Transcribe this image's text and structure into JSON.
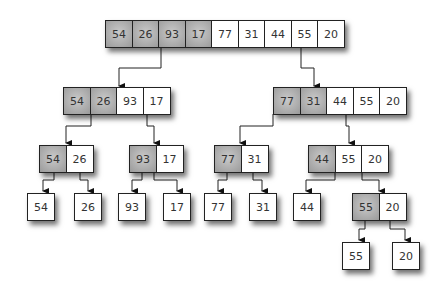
{
  "diagram": {
    "levels": [
      {
        "groups": [
          {
            "values": [
              "54",
              "26",
              "93",
              "17",
              "77",
              "31",
              "44",
              "55",
              "20"
            ],
            "highlighted": [
              0,
              1,
              2,
              3
            ]
          }
        ]
      },
      {
        "groups": [
          {
            "values": [
              "54",
              "26",
              "93",
              "17"
            ],
            "highlighted": [
              0,
              1
            ]
          },
          {
            "values": [
              "77",
              "31",
              "44",
              "55",
              "20"
            ],
            "highlighted": [
              0,
              1
            ]
          }
        ]
      },
      {
        "groups": [
          {
            "values": [
              "54",
              "26"
            ],
            "highlighted": [
              0
            ]
          },
          {
            "values": [
              "93",
              "17"
            ],
            "highlighted": [
              0
            ]
          },
          {
            "values": [
              "77",
              "31"
            ],
            "highlighted": [
              0
            ]
          },
          {
            "values": [
              "44",
              "55",
              "20"
            ],
            "highlighted": [
              0
            ]
          }
        ]
      },
      {
        "groups": [
          {
            "values": [
              "54"
            ]
          },
          {
            "values": [
              "26"
            ]
          },
          {
            "values": [
              "93"
            ]
          },
          {
            "values": [
              "17"
            ]
          },
          {
            "values": [
              "77"
            ]
          },
          {
            "values": [
              "31"
            ]
          },
          {
            "values": [
              "44"
            ]
          },
          {
            "values": [
              "55",
              "20"
            ],
            "highlighted": [
              0
            ]
          }
        ]
      },
      {
        "groups": [
          {
            "values": [
              "55"
            ]
          },
          {
            "values": [
              "20"
            ]
          }
        ]
      }
    ]
  },
  "l1": [
    "54",
    "26",
    "93",
    "17",
    "77",
    "31",
    "44",
    "55",
    "20"
  ],
  "l2a": [
    "54",
    "26",
    "93",
    "17"
  ],
  "l2b": [
    "77",
    "31",
    "44",
    "55",
    "20"
  ],
  "l3a": [
    "54",
    "26"
  ],
  "l3b": [
    "93",
    "17"
  ],
  "l3c": [
    "77",
    "31"
  ],
  "l3d": [
    "44",
    "55",
    "20"
  ],
  "l4": [
    "54",
    "26",
    "93",
    "17",
    "77",
    "31",
    "44"
  ],
  "l4h": [
    "55",
    "20"
  ],
  "l5": [
    "55",
    "20"
  ],
  "colors": {
    "highlight": "#a8a8a8",
    "border": "#222222",
    "background": "#ffffff"
  }
}
